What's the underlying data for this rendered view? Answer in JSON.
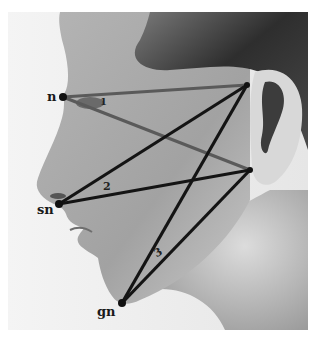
{
  "figure": {
    "colors": {
      "background": "#ffffff",
      "photo_bg": "#ededed",
      "skin_light": "#c9c9c9",
      "skin_mid": "#a8a8a8",
      "hair_dark": "#3a3a3a",
      "line_black": "#141414",
      "line_gray": "#5a5a5a"
    }
  },
  "landmarks": [
    {
      "id": "n",
      "label": "n",
      "x": 63,
      "y": 97
    },
    {
      "id": "sn",
      "label": "sn",
      "x": 59,
      "y": 204
    },
    {
      "id": "gn",
      "label": "gn",
      "x": 122,
      "y": 303
    },
    {
      "id": "ear_upper",
      "label": "",
      "x": 247,
      "y": 85
    },
    {
      "id": "ear_lower",
      "label": "",
      "x": 250,
      "y": 170
    }
  ],
  "lines": [
    {
      "from": "n",
      "to": "ear_upper",
      "color": "gray"
    },
    {
      "from": "n",
      "to": "ear_lower",
      "color": "gray"
    },
    {
      "from": "sn",
      "to": "ear_upper",
      "color": "black"
    },
    {
      "from": "sn",
      "to": "ear_lower",
      "color": "black"
    },
    {
      "from": "gn",
      "to": "ear_upper",
      "color": "black"
    },
    {
      "from": "gn",
      "to": "ear_lower",
      "color": "black"
    }
  ],
  "labels": {
    "n": "n",
    "sn": "sn",
    "gn": "gn",
    "angle_1": "1",
    "angle_2": "2",
    "angle_3": "3"
  }
}
